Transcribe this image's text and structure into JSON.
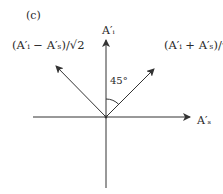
{
  "figure": {
    "panel_label": "(c)",
    "axes": {
      "vertical_label": "A′ᵢ",
      "horizontal_label": "A′ₛ"
    },
    "vectors": {
      "difference_label": "(A′ᵢ − A′ₛ)/√2",
      "sum_label": "(A′ᵢ + A′ₛ)/√2"
    },
    "angle_label": "45°",
    "colors": {
      "line": "#333333",
      "text": "#2a2a2a",
      "background": "#ffffff"
    }
  }
}
